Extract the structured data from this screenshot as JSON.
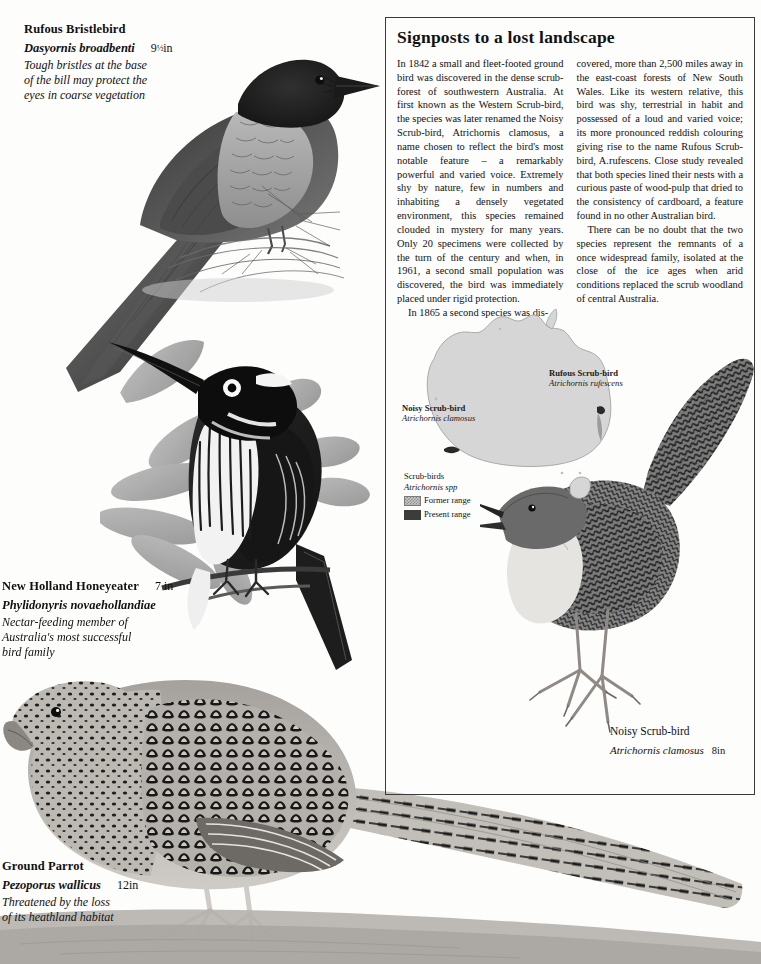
{
  "page": {
    "width": 761,
    "height": 964,
    "background": "#fdfdfc"
  },
  "article": {
    "title": "Signposts to a lost  landscape",
    "border_color": "#3a3a3a",
    "column_left": [
      "In 1842 a small and fleet-footed ground bird was discovered in the dense scrub-forest of southwestern Australia. At first known as the Western Scrub-bird, the species was later renamed the Noisy Scrub-bird, Atrichornis clamosus, a name chosen to reflect the bird's most notable feature – a remarkably powerful and varied voice. Extremely shy by nature, few in numbers and inhabiting a densely vegetated environment, this species remained clouded in mystery for many years. Only 20 specimens were collected by the turn of the century and when, in 1961, a second small population was discovered, the bird was immediately placed under rigid protection.",
      "In 1865 a second species was dis-"
    ],
    "column_right": [
      "covered, more than 2,500 miles away in the east-coast forests of New South Wales. Like its western relative, this bird was shy, terrestrial in habit and possessed of a loud and varied voice; its more pronounced reddish colouring giving rise to the name Rufous Scrub-bird, A.rufescens. Close study revealed that both species lined their nests with a curious paste of wood-pulp that dried to the consistency of cardboard, a feature found in no other Australian bird.",
      "There can be no doubt that the two species represent the remnants of a once widespread family, isolated at the close of the ice ages when arid conditions replaced the scrub woodland of central Australia."
    ]
  },
  "map": {
    "region": "Australia",
    "land_fill": "#d6d6d6",
    "coast_stroke": "#9a9a9a",
    "labels": [
      {
        "id": "noisy-scrub-bird",
        "common": "Noisy Scrub-bird",
        "scientific": "Atrichornis clamosus",
        "x": 8,
        "y": 100
      },
      {
        "id": "rufous-scrub-bird",
        "common": "Rufous Scrub-bird",
        "scientific": "Atrichornis rufescens",
        "x": 155,
        "y": 65
      }
    ],
    "legend": {
      "title": "Scrub-birds",
      "scientific": "Atrichornis spp",
      "items": [
        {
          "label": "Former range",
          "swatch": "former",
          "color": "#c9c9c9"
        },
        {
          "label": "Present range",
          "swatch": "present",
          "color": "#3c3c3c"
        }
      ]
    }
  },
  "captions": [
    {
      "id": "rufous-bristlebird",
      "common": "Rufous Bristlebird",
      "scientific": "Dasyornis broadbenti",
      "size_whole": "9",
      "size_fraction": "½",
      "size_unit": "in",
      "note": "Tough bristles at the base of the bill may protect the eyes in coarse vegetation",
      "note_lines": [
        "Tough bristles at the base",
        "of the bill may protect the",
        "eyes in coarse vegetation"
      ],
      "x": 24,
      "y": 19
    },
    {
      "id": "new-holland-honeyeater",
      "common": "New Holland Honeyeater",
      "scientific": "Phylidonyris novaehollandiae",
      "size_whole": "7",
      "size_fraction": "",
      "size_unit": " in",
      "note_lines": [
        "Nectar-feeding member of",
        "Australia's most successful",
        "bird family"
      ],
      "x": 2,
      "y": 576
    },
    {
      "id": "ground-parrot",
      "common": "Ground Parrot",
      "scientific": "Pezoporus wallicus",
      "size_whole": "12",
      "size_fraction": "",
      "size_unit": "in",
      "note_lines": [
        "Threatened by the loss",
        "of its heathland habitat"
      ],
      "x": 2,
      "y": 856
    },
    {
      "id": "noisy-scrub-bird",
      "common": "Noisy Scrub-bird",
      "scientific": "Atrichornis clamosus",
      "size_whole": "8",
      "size_fraction": "",
      "size_unit": "in",
      "note_lines": [],
      "x": 610,
      "y": 721
    }
  ],
  "illustrations": [
    {
      "id": "rufous-bristlebird",
      "subject": "Rufous Bristlebird perched on grass tussock",
      "style": "greyscale-engraving"
    },
    {
      "id": "new-holland-honeyeater",
      "subject": "New Holland Honeyeater perched on banksia branch",
      "style": "greyscale-engraving"
    },
    {
      "id": "ground-parrot",
      "subject": "Ground Parrot standing on ground",
      "style": "greyscale-engraving"
    },
    {
      "id": "noisy-scrub-bird",
      "subject": "Noisy Scrub-bird with raised tail",
      "style": "greyscale-engraving"
    }
  ]
}
